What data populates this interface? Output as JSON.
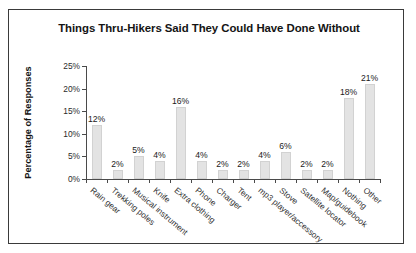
{
  "chart_data": {
    "type": "bar",
    "title": "Things Thru-Hikers Said They Could Have Done Without",
    "xlabel": "",
    "ylabel": "Percentage of Responses",
    "ylim": [
      0,
      25
    ],
    "ytick_labels": [
      "0%",
      "5%",
      "10%",
      "15%",
      "20%",
      "25%"
    ],
    "ytick_values": [
      0,
      5,
      10,
      15,
      20,
      25
    ],
    "grid": false,
    "legend": "none",
    "categories": [
      "Rain gear",
      "Trekking poles",
      "Musical instrument",
      "Knife",
      "Extra clothing",
      "Phone",
      "Charger",
      "Tent",
      "mp3 player/accessory",
      "Stove",
      "Satellite locator",
      "Map/guidebook",
      "Nothing",
      "Other"
    ],
    "values": [
      12,
      2,
      5,
      4,
      16,
      4,
      2,
      2,
      4,
      6,
      2,
      2,
      18,
      21
    ],
    "value_labels": [
      "12%",
      "2%",
      "5%",
      "4%",
      "16%",
      "4%",
      "2%",
      "2%",
      "4%",
      "6%",
      "2%",
      "2%",
      "18%",
      "21%"
    ],
    "colors": {
      "bar_fill": "#e3e3e3",
      "bar_edge": "#d2d2d2",
      "axis": "#4a4a4a",
      "text": "#141414",
      "frame": "#3a3a3a",
      "background": "#ffffff"
    }
  }
}
